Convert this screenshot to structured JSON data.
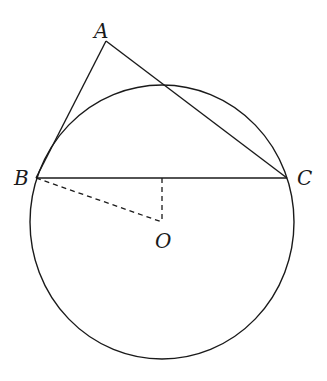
{
  "diagram": {
    "type": "geometry",
    "colors": {
      "stroke": "#1a1a1a",
      "background": "#ffffff"
    },
    "circle": {
      "center_label": "O",
      "cx": 162,
      "cy": 222,
      "rx": 132,
      "ry": 137
    },
    "points": {
      "A": {
        "label": "A",
        "x": 106,
        "y": 41
      },
      "B": {
        "label": "B",
        "x": 36,
        "y": 178
      },
      "C": {
        "label": "C",
        "x": 287,
        "y": 178
      },
      "O": {
        "label": "O",
        "x": 162,
        "y": 222
      },
      "M": {
        "x": 162,
        "y": 178
      }
    },
    "segments": [
      {
        "from": "A",
        "to": "B",
        "style": "solid"
      },
      {
        "from": "A",
        "to": "C",
        "style": "solid"
      },
      {
        "from": "B",
        "to": "C",
        "style": "solid"
      },
      {
        "from": "B",
        "to": "O",
        "style": "dashed"
      },
      {
        "from": "M",
        "to": "O",
        "style": "dashed"
      }
    ]
  }
}
